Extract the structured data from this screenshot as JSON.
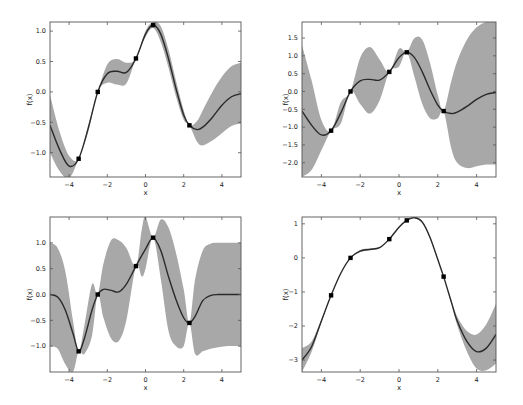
{
  "figure": {
    "colors": {
      "band": "#a8a8a8",
      "mean": "#2a2a2a",
      "points": "#000000",
      "axes": "#555555"
    }
  },
  "chart_data": [
    {
      "type": "area",
      "panel": "top-left",
      "title": "",
      "xlabel": "x",
      "ylabel": "f(x)",
      "xlim": [
        -5,
        5
      ],
      "ylim": [
        -1.4,
        1.15
      ],
      "xticks": [
        -4,
        -2,
        0,
        2,
        4
      ],
      "xtick_labels": [
        "−4",
        "−2",
        "0",
        "2",
        "4"
      ],
      "yticks": [
        -1.0,
        -0.5,
        0.0,
        0.5,
        1.0
      ],
      "ytick_labels": [
        "−1.0",
        "−0.5",
        "0.0",
        "0.5",
        "1.0"
      ],
      "grid": false,
      "observations": {
        "x": [
          -3.5,
          -2.5,
          -0.5,
          0.4,
          2.3
        ],
        "y": [
          -1.1,
          0.0,
          0.55,
          1.1,
          -0.55
        ]
      },
      "series": [
        {
          "name": "mean",
          "x": [
            -5,
            -4.5,
            -4,
            -3.5,
            -3,
            -2.5,
            -2,
            -1.5,
            -1,
            -0.5,
            0,
            0.4,
            0.8,
            1.2,
            1.6,
            2,
            2.3,
            2.7,
            3,
            3.5,
            4,
            4.5,
            5
          ],
          "y": [
            -0.55,
            -0.95,
            -1.22,
            -1.1,
            -0.6,
            0.0,
            0.3,
            0.34,
            0.32,
            0.55,
            0.95,
            1.1,
            0.95,
            0.55,
            0.05,
            -0.38,
            -0.55,
            -0.62,
            -0.58,
            -0.42,
            -0.22,
            -0.08,
            -0.03
          ]
        },
        {
          "name": "upper",
          "x": [
            -5,
            -4.5,
            -4,
            -3.5,
            -3,
            -2.5,
            -2,
            -1.5,
            -1,
            -0.5,
            0,
            0.4,
            0.8,
            1.2,
            1.6,
            2,
            2.3,
            2.7,
            3,
            3.5,
            4,
            4.5,
            5
          ],
          "y": [
            -0.05,
            -0.65,
            -1.05,
            -1.1,
            -0.55,
            0.0,
            0.45,
            0.54,
            0.48,
            0.55,
            1.0,
            1.15,
            1.08,
            0.7,
            0.18,
            -0.3,
            -0.55,
            -0.48,
            -0.3,
            0.0,
            0.25,
            0.42,
            0.48
          ]
        },
        {
          "name": "lower",
          "x": [
            -5,
            -4.5,
            -4,
            -3.5,
            -3,
            -2.5,
            -2,
            -1.5,
            -1,
            -0.5,
            0,
            0.4,
            0.8,
            1.2,
            1.6,
            2,
            2.3,
            2.7,
            3,
            3.5,
            4,
            4.5,
            5
          ],
          "y": [
            -1.0,
            -1.3,
            -1.42,
            -1.1,
            -0.66,
            0.0,
            0.15,
            0.12,
            0.14,
            0.55,
            0.9,
            1.05,
            0.82,
            0.4,
            -0.08,
            -0.46,
            -0.55,
            -0.82,
            -0.88,
            -0.8,
            -0.68,
            -0.56,
            -0.52
          ]
        }
      ]
    },
    {
      "type": "area",
      "panel": "top-right",
      "title": "",
      "xlabel": "x",
      "ylabel": "f(x)",
      "xlim": [
        -5,
        5
      ],
      "ylim": [
        -2.4,
        1.95
      ],
      "xticks": [
        -4,
        -2,
        0,
        2,
        4
      ],
      "xtick_labels": [
        "−4",
        "−2",
        "0",
        "2",
        "4"
      ],
      "yticks": [
        -2.0,
        -1.5,
        -1.0,
        -0.5,
        0.0,
        0.5,
        1.0,
        1.5
      ],
      "ytick_labels": [
        "−2.0",
        "−1.5",
        "−1.0",
        "−0.5",
        "0.0",
        "0.5",
        "1.0",
        "1.5"
      ],
      "grid": false,
      "observations": {
        "x": [
          -3.5,
          -2.5,
          -0.5,
          0.4,
          2.3
        ],
        "y": [
          -1.1,
          0.0,
          0.55,
          1.1,
          -0.55
        ]
      },
      "series": [
        {
          "name": "mean",
          "x": [
            -5,
            -4.5,
            -4,
            -3.5,
            -3,
            -2.5,
            -2,
            -1.5,
            -1,
            -0.5,
            0,
            0.4,
            0.8,
            1.2,
            1.6,
            2,
            2.3,
            2.7,
            3,
            3.5,
            4,
            4.5,
            5
          ],
          "y": [
            -0.55,
            -0.95,
            -1.22,
            -1.1,
            -0.6,
            0.0,
            0.3,
            0.34,
            0.32,
            0.55,
            0.95,
            1.1,
            0.95,
            0.55,
            0.05,
            -0.38,
            -0.55,
            -0.62,
            -0.58,
            -0.42,
            -0.22,
            -0.08,
            -0.03
          ]
        },
        {
          "name": "upper",
          "x": [
            -5,
            -4.5,
            -4,
            -3.5,
            -3,
            -2.5,
            -2,
            -1.5,
            -1,
            -0.5,
            0,
            0.4,
            0.8,
            1.2,
            1.6,
            2,
            2.3,
            2.7,
            3,
            3.5,
            4,
            4.5,
            5
          ],
          "y": [
            1.3,
            0.3,
            -0.8,
            -1.1,
            -0.3,
            0.0,
            0.95,
            1.25,
            0.9,
            0.55,
            1.2,
            1.1,
            1.5,
            1.45,
            0.8,
            -0.1,
            -0.55,
            0.3,
            0.85,
            1.45,
            1.8,
            1.95,
            1.95
          ]
        },
        {
          "name": "lower",
          "x": [
            -5,
            -4.5,
            -4,
            -3.5,
            -3,
            -2.5,
            -2,
            -1.5,
            -1,
            -0.5,
            0,
            0.4,
            0.8,
            1.2,
            1.6,
            2,
            2.3,
            2.7,
            3,
            3.5,
            4,
            4.5,
            5
          ],
          "y": [
            -2.4,
            -2.2,
            -1.65,
            -1.1,
            -0.9,
            0.0,
            -0.35,
            -0.62,
            -0.25,
            0.55,
            0.7,
            1.1,
            0.4,
            -0.35,
            -0.75,
            -0.75,
            -0.55,
            -1.6,
            -2.0,
            -2.15,
            -2.1,
            -2.05,
            -2.05
          ]
        }
      ]
    },
    {
      "type": "area",
      "panel": "bottom-left",
      "title": "",
      "xlabel": "x",
      "ylabel": "f(x)",
      "xlim": [
        -5,
        5
      ],
      "ylim": [
        -1.5,
        1.5
      ],
      "xticks": [
        -4,
        -2,
        0,
        2,
        4
      ],
      "xtick_labels": [
        "−4",
        "−2",
        "0",
        "2",
        "4"
      ],
      "yticks": [
        -1.0,
        -0.5,
        0.0,
        0.5,
        1.0
      ],
      "ytick_labels": [
        "−1.0",
        "−0.5",
        "0.0",
        "0.5",
        "1.0"
      ],
      "grid": false,
      "observations": {
        "x": [
          -3.5,
          -2.5,
          -0.5,
          0.4,
          2.3
        ],
        "y": [
          -1.1,
          0.0,
          0.55,
          1.1,
          -0.55
        ]
      },
      "series": [
        {
          "name": "mean",
          "x": [
            -5,
            -4.6,
            -4.2,
            -3.8,
            -3.5,
            -3.2,
            -2.8,
            -2.5,
            -2.2,
            -1.8,
            -1.4,
            -1.0,
            -0.5,
            0,
            0.4,
            0.8,
            1.2,
            1.6,
            2.0,
            2.3,
            2.6,
            3.0,
            3.4,
            3.8,
            4.2,
            5
          ],
          "y": [
            0.0,
            -0.05,
            -0.3,
            -0.75,
            -1.1,
            -0.85,
            -0.3,
            0.0,
            0.1,
            0.08,
            0.05,
            0.2,
            0.55,
            0.88,
            1.1,
            0.85,
            0.35,
            -0.1,
            -0.45,
            -0.55,
            -0.42,
            -0.12,
            -0.02,
            0.0,
            0.0,
            0.0
          ]
        },
        {
          "name": "upper",
          "x": [
            -5,
            -4.6,
            -4.2,
            -3.8,
            -3.5,
            -3.2,
            -2.8,
            -2.5,
            -2.2,
            -1.8,
            -1.4,
            -1.0,
            -0.5,
            -0.2,
            0,
            0.4,
            0.8,
            1.2,
            1.6,
            2.0,
            2.3,
            2.6,
            3.0,
            3.4,
            3.8,
            4.2,
            5
          ],
          "y": [
            1.0,
            0.9,
            0.45,
            -0.5,
            -1.1,
            -0.6,
            0.2,
            0.0,
            0.6,
            1.05,
            1.05,
            0.9,
            0.55,
            1.25,
            1.5,
            1.1,
            1.45,
            1.3,
            0.8,
            0.1,
            -0.55,
            0.3,
            0.85,
            0.98,
            1.0,
            1.0,
            1.0
          ]
        },
        {
          "name": "lower",
          "x": [
            -5,
            -4.6,
            -4.2,
            -3.8,
            -3.5,
            -3.2,
            -2.8,
            -2.5,
            -2.2,
            -1.8,
            -1.4,
            -1.0,
            -0.5,
            -0.2,
            0,
            0.4,
            0.8,
            1.2,
            1.6,
            2.0,
            2.3,
            2.6,
            3.0,
            3.4,
            3.8,
            4.2,
            5
          ],
          "y": [
            -1.0,
            -1.05,
            -1.35,
            -1.5,
            -1.1,
            -1.15,
            -0.8,
            0.0,
            -0.45,
            -0.85,
            -0.9,
            -0.5,
            0.55,
            0.35,
            0.5,
            1.1,
            0.3,
            -0.7,
            -1.0,
            -1.0,
            -0.55,
            -1.15,
            -1.1,
            -1.05,
            -1.02,
            -1.0,
            -1.0
          ]
        }
      ]
    },
    {
      "type": "area",
      "panel": "bottom-right",
      "title": "",
      "xlabel": "x",
      "ylabel": "f(x)",
      "xlim": [
        -5,
        5
      ],
      "ylim": [
        -3.35,
        1.2
      ],
      "xticks": [
        -4,
        -2,
        0,
        2,
        4
      ],
      "xtick_labels": [
        "−4",
        "−2",
        "0",
        "2",
        "4"
      ],
      "yticks": [
        -3,
        -2,
        -1,
        0,
        1
      ],
      "ytick_labels": [
        "−3",
        "−2",
        "−1",
        "0",
        "1"
      ],
      "grid": false,
      "observations": {
        "x": [
          -3.5,
          -2.5,
          -0.5,
          0.4,
          2.3
        ],
        "y": [
          -1.1,
          0.0,
          0.55,
          1.1,
          -0.55
        ]
      },
      "series": [
        {
          "name": "mean",
          "x": [
            -5,
            -4.5,
            -4,
            -3.5,
            -3,
            -2.5,
            -2,
            -1.5,
            -1,
            -0.5,
            0,
            0.4,
            0.8,
            1.2,
            1.6,
            2,
            2.3,
            2.7,
            3,
            3.5,
            4,
            4.5,
            5
          ],
          "y": [
            -3.0,
            -2.6,
            -1.85,
            -1.1,
            -0.45,
            0.0,
            0.2,
            0.25,
            0.3,
            0.55,
            0.9,
            1.1,
            1.18,
            1.05,
            0.6,
            -0.05,
            -0.55,
            -1.3,
            -1.85,
            -2.45,
            -2.75,
            -2.65,
            -2.25
          ]
        },
        {
          "name": "upper",
          "x": [
            -5,
            -4.5,
            -4,
            -3.5,
            -3,
            -2.5,
            -2,
            -1.5,
            -1,
            -0.5,
            0,
            0.4,
            0.8,
            1.2,
            1.6,
            2,
            2.3,
            2.7,
            3,
            3.5,
            4,
            4.5,
            5
          ],
          "y": [
            -2.65,
            -2.45,
            -1.8,
            -1.1,
            -0.44,
            0.0,
            0.23,
            0.28,
            0.32,
            0.55,
            0.92,
            1.1,
            1.2,
            1.08,
            0.63,
            -0.03,
            -0.55,
            -1.25,
            -1.72,
            -2.15,
            -2.25,
            -1.95,
            -1.35
          ]
        },
        {
          "name": "lower",
          "x": [
            -5,
            -4.5,
            -4,
            -3.5,
            -3,
            -2.5,
            -2,
            -1.5,
            -1,
            -0.5,
            0,
            0.4,
            0.8,
            1.2,
            1.6,
            2,
            2.3,
            2.7,
            3,
            3.5,
            4,
            4.5,
            5
          ],
          "y": [
            -3.35,
            -2.75,
            -1.9,
            -1.1,
            -0.46,
            0.0,
            0.17,
            0.22,
            0.28,
            0.55,
            0.88,
            1.1,
            1.16,
            1.02,
            0.57,
            -0.07,
            -0.55,
            -1.35,
            -1.98,
            -2.75,
            -3.25,
            -3.3,
            -3.1
          ]
        }
      ]
    }
  ]
}
